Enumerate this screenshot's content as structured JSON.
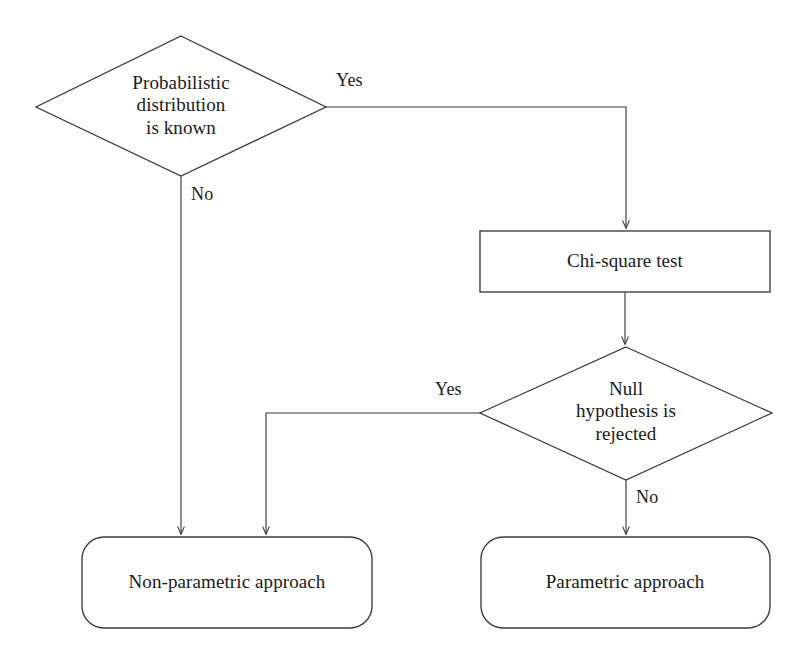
{
  "diagram": {
    "background_color": "#fefefe",
    "stroke_color": "#3a3a3a",
    "text_color": "#1a1a1a",
    "nodes": [
      {
        "id": "decision-distribution",
        "shape": "diamond",
        "text": "Probabilistic\ndistribution\nis known"
      },
      {
        "id": "process-chisquare",
        "shape": "rectangle",
        "text": "Chi-square test"
      },
      {
        "id": "decision-null",
        "shape": "diamond",
        "text": "Null\nhypothesis is\nrejected"
      },
      {
        "id": "terminal-nonparametric",
        "shape": "rounded-rectangle",
        "text": "Non-parametric approach"
      },
      {
        "id": "terminal-parametric",
        "shape": "rounded-rectangle",
        "text": "Parametric approach"
      }
    ],
    "edges": [
      {
        "id": "edge-distribution-yes",
        "from": "decision-distribution",
        "to": "process-chisquare",
        "label": "Yes"
      },
      {
        "id": "edge-distribution-no",
        "from": "decision-distribution",
        "to": "terminal-nonparametric",
        "label": "No"
      },
      {
        "id": "edge-chisquare-null",
        "from": "process-chisquare",
        "to": "decision-null",
        "label": ""
      },
      {
        "id": "edge-null-yes",
        "from": "decision-null",
        "to": "terminal-nonparametric",
        "label": "Yes"
      },
      {
        "id": "edge-null-no",
        "from": "decision-null",
        "to": "terminal-parametric",
        "label": "No"
      }
    ]
  }
}
